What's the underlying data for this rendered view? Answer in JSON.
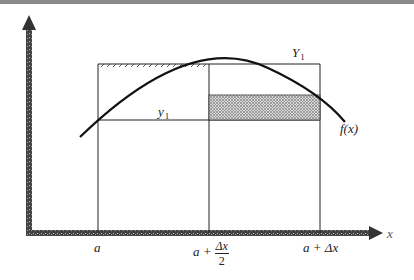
{
  "figure": {
    "labels": {
      "curve": "f(x)",
      "upper_value_var": "Y",
      "upper_value_sub": "1",
      "lower_value_var": "y",
      "lower_value_sub": "1",
      "x_axis": "x",
      "tick_a": "a",
      "tick_mid_prefix": "a +",
      "tick_mid_num": "Δx",
      "tick_mid_den": "2",
      "tick_end": "a + Δx"
    },
    "colors": {
      "line": "#111111",
      "axis": "#3a3a3a",
      "shade": "#7a7a7a",
      "topbar": "#8a8a8a"
    },
    "geometry": {
      "x_a": 98,
      "x_mid": 209,
      "x_end": 320,
      "y_top": 64,
      "y_low": 120,
      "shade_top": 95,
      "axis_y": 233,
      "axis_x": 29
    }
  }
}
